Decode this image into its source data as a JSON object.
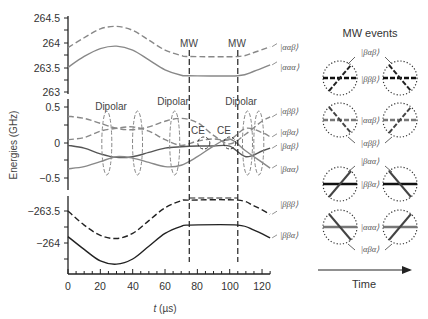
{
  "chart_data": {
    "type": "line",
    "title": "",
    "xlabel": "t (µs)",
    "ylabel": "Energies (GHz)",
    "xlim": [
      0,
      125
    ],
    "x_ticks": [
      0,
      20,
      40,
      60,
      80,
      100,
      120
    ],
    "panels": [
      {
        "name": "top",
        "ylim": [
          263,
          264.5
        ],
        "y_ticks": [
          "263",
          "263.5",
          "264",
          "264.5"
        ],
        "series": [
          {
            "name": "|ααβ⟩",
            "style": "dashed",
            "color": "#888888",
            "x": [
              0,
              10,
              20,
              30,
              40,
              50,
              60,
              70,
              75,
              105,
              115,
              125
            ],
            "values": [
              263.9,
              264.1,
              264.28,
              264.33,
              264.25,
              264.05,
              263.85,
              263.74,
              263.72,
              263.72,
              263.8,
              263.92
            ]
          },
          {
            "name": "|ααα⟩",
            "style": "solid",
            "color": "#888888",
            "x": [
              0,
              10,
              20,
              30,
              40,
              50,
              60,
              70,
              75,
              105,
              115,
              125
            ],
            "values": [
              263.5,
              263.72,
              263.88,
              263.93,
              263.85,
              263.65,
              263.45,
              263.34,
              263.33,
              263.33,
              263.42,
              263.55
            ]
          }
        ]
      },
      {
        "name": "middle",
        "ylim": [
          -0.5,
          0.5
        ],
        "y_ticks": [
          "−0.5",
          "0",
          "0.5"
        ],
        "series": [
          {
            "name": "|αββ⟩",
            "style": "dashed",
            "color": "#888888",
            "x": [
              0,
              10,
              20,
              30,
              40,
              50,
              60,
              70,
              80,
              90,
              100,
              110,
              120,
              125
            ],
            "values": [
              0.37,
              0.34,
              0.27,
              0.2,
              0.18,
              0.22,
              0.3,
              0.34,
              0.28,
              0.1,
              -0.02,
              0.12,
              0.3,
              0.36
            ]
          },
          {
            "name": "|αβα⟩",
            "style": "dashed",
            "color": "#888888",
            "x": [
              0,
              10,
              20,
              30,
              40,
              50,
              60,
              70,
              80,
              90,
              100,
              110,
              120,
              125
            ],
            "values": [
              0.04,
              0.07,
              0.16,
              0.2,
              0.22,
              0.16,
              0.04,
              -0.04,
              0.02,
              0.05,
              0.04,
              0.2,
              0.14,
              0.08
            ]
          },
          {
            "name": "|βαβ⟩",
            "style": "solid",
            "color": "#555555",
            "x": [
              0,
              10,
              20,
              30,
              40,
              50,
              60,
              70,
              80,
              90,
              100,
              110,
              120,
              125
            ],
            "values": [
              -0.04,
              -0.08,
              -0.16,
              -0.21,
              -0.2,
              -0.14,
              -0.08,
              -0.06,
              -0.05,
              -0.05,
              -0.05,
              -0.2,
              -0.12,
              -0.08
            ]
          },
          {
            "name": "|βαα⟩",
            "style": "solid",
            "color": "#888888",
            "x": [
              0,
              10,
              20,
              30,
              40,
              50,
              60,
              70,
              80,
              90,
              100,
              110,
              120,
              125
            ],
            "values": [
              -0.37,
              -0.34,
              -0.27,
              -0.2,
              -0.22,
              -0.28,
              -0.34,
              -0.32,
              -0.2,
              -0.05,
              0.05,
              -0.12,
              -0.28,
              -0.36
            ]
          }
        ]
      },
      {
        "name": "bottom",
        "ylim": [
          -264.25,
          -263.45
        ],
        "y_ticks": [
          "−264",
          "−263.5"
        ],
        "series": [
          {
            "name": "|βββ⟩",
            "style": "dashed",
            "color": "#222222",
            "x": [
              0,
              10,
              20,
              30,
              40,
              50,
              60,
              70,
              75,
              105,
              115,
              125
            ],
            "values": [
              -263.5,
              -263.72,
              -263.88,
              -263.93,
              -263.85,
              -263.65,
              -263.45,
              -263.34,
              -263.33,
              -263.33,
              -263.42,
              -263.55
            ]
          },
          {
            "name": "|ββα⟩",
            "style": "solid",
            "color": "#222222",
            "x": [
              0,
              10,
              20,
              30,
              40,
              50,
              60,
              70,
              75,
              105,
              115,
              125
            ],
            "values": [
              -263.9,
              -264.1,
              -264.28,
              -264.33,
              -264.25,
              -264.05,
              -263.85,
              -263.74,
              -263.72,
              -263.72,
              -263.8,
              -263.92
            ]
          }
        ]
      }
    ],
    "annotations": [
      {
        "text": "MW",
        "x": 75
      },
      {
        "text": "MW",
        "x": 105
      },
      {
        "text": "Dipolar",
        "x": 24
      },
      {
        "text": "Dipolar",
        "x": 63
      },
      {
        "text": "Dipolar",
        "x": 110
      },
      {
        "text": "CE",
        "x": 85
      },
      {
        "text": "CE",
        "x": 100
      }
    ],
    "grid": false,
    "legend_position": "right (inline labels)"
  },
  "labels": {
    "ylabel": "Energies (GHz)",
    "xlabel_t": "t",
    "xlabel_unit": " (µs)",
    "mw": "MW",
    "dipolar": "Dipolar",
    "ce": "CE",
    "states": {
      "aab": "|ααβ⟩",
      "aaa": "|ααα⟩",
      "abb": "|αββ⟩",
      "aba": "|αβα⟩",
      "bab": "|βαβ⟩",
      "baa": "|βαα⟩",
      "bbb": "|βββ⟩",
      "bba": "|ββα⟩"
    }
  },
  "ticks": {
    "top": [
      "264.5",
      "264",
      "263.5",
      "263"
    ],
    "middle": [
      "0.5",
      "0",
      "−0.5"
    ],
    "bottom": [
      "−263.5",
      "−264"
    ],
    "x": [
      "0",
      "20",
      "40",
      "60",
      "80",
      "100",
      "120"
    ]
  },
  "mw_events": {
    "title": "MW events",
    "time_label": "Time",
    "groups": [
      {
        "top_state": "|βαβ⟩",
        "center_state": "|βββ⟩",
        "bottom_state": ""
      },
      {
        "top_state": "",
        "center_state": "|ααβ⟩",
        "bottom_state": "|αββ⟩"
      },
      {
        "top_state": "|βαα⟩",
        "center_state": "|ββα⟩",
        "bottom_state": ""
      },
      {
        "top_state": "",
        "center_state": "|ααα⟩",
        "bottom_state": "|αβα⟩"
      }
    ]
  }
}
